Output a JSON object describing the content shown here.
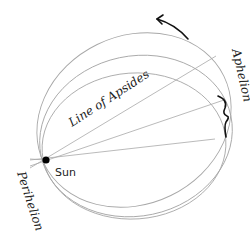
{
  "diagram": {
    "labels": {
      "sun": "Sun",
      "line_of_apsides": "Line of Apsides",
      "aphelion": "Aphelion",
      "perihelion": "Perihelion"
    },
    "colors": {
      "orbit_stroke": "#a8a8a8",
      "arrow": "#111111",
      "sun": "#000000",
      "text": "#222222"
    },
    "orbit_count": 3,
    "apsides_line_count": 3
  }
}
